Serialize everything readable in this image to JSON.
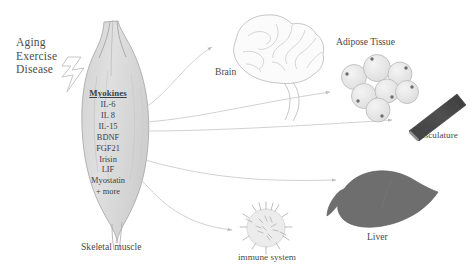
{
  "figure": {
    "background_color": "#ffffff",
    "width": 475,
    "height": 274
  },
  "stimuli": {
    "items": [
      "Aging",
      "Exercise",
      "Disease"
    ],
    "arrow_icon": "lightning-bolt-arrow"
  },
  "source_organ": {
    "label": "Skeletal muscle",
    "fill_color": "#dcdcdc",
    "outline_color": "#9a9a9a"
  },
  "myokines": {
    "title": "Myokines",
    "items": [
      "IL-6",
      "IL 8",
      "IL-15",
      "BDNF",
      "FGF21",
      "Irisin",
      "LIF",
      "Myostatin",
      "+ more"
    ]
  },
  "targets": [
    {
      "label": "Brain",
      "icon": "brain-icon",
      "color": "#b9b9b9"
    },
    {
      "label": "Adipose Tissue",
      "icon": "adipose-tissue-icon",
      "color": "#d8d8d8"
    },
    {
      "label": "Vasculature",
      "icon": "blood-vessel-icon",
      "color": "#4a4a4a"
    },
    {
      "label": "Liver",
      "icon": "liver-icon",
      "color": "#6e6e6e"
    },
    {
      "label": "immune system",
      "icon": "immune-cell-icon",
      "color": "#c9c9c9"
    }
  ],
  "arrows": {
    "count": 5,
    "color": "#c2c2c2",
    "style": "thin-curved-arrow"
  }
}
